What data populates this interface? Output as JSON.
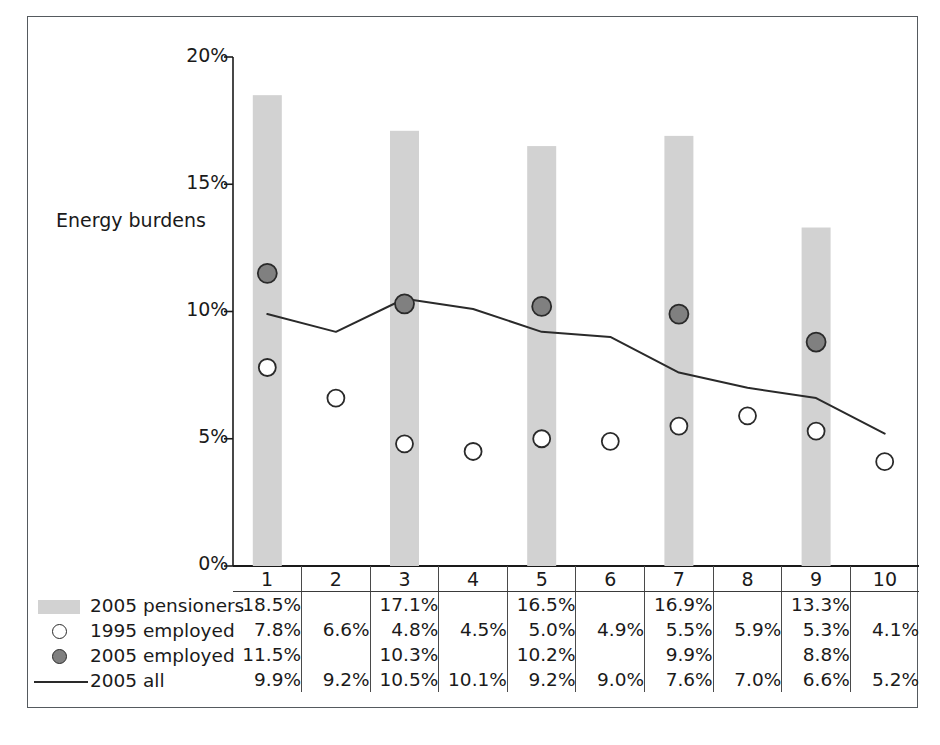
{
  "chart_data": {
    "type": "bar",
    "title": "",
    "xlabel": "",
    "ylabel": "Energy burdens",
    "ylim": [
      0,
      20
    ],
    "ytick_labels": [
      "20%",
      "15%",
      "10%",
      "5%",
      "0%"
    ],
    "ytick_values": [
      20,
      15,
      10,
      5,
      0
    ],
    "grid": false,
    "legend_position": "bottom-left-table",
    "categories": [
      "1",
      "2",
      "3",
      "4",
      "5",
      "6",
      "7",
      "8",
      "9",
      "10"
    ],
    "series": [
      {
        "name": "2005 pensioners",
        "render": "bar",
        "color": "#d2d2d2",
        "values": [
          18.5,
          null,
          17.1,
          null,
          16.5,
          null,
          16.9,
          null,
          13.3,
          null
        ],
        "labels": [
          "18.5%",
          "",
          "17.1%",
          "",
          "16.5%",
          "",
          "16.9%",
          "",
          "13.3%",
          ""
        ]
      },
      {
        "name": "1995 employed",
        "render": "open-circle",
        "color": "#ffffff",
        "values": [
          7.8,
          6.6,
          4.8,
          4.5,
          5.0,
          4.9,
          5.5,
          5.9,
          5.3,
          4.1
        ],
        "labels": [
          "7.8%",
          "6.6%",
          "4.8%",
          "4.5%",
          "5.0%",
          "4.9%",
          "5.5%",
          "5.9%",
          "5.3%",
          "4.1%"
        ]
      },
      {
        "name": "2005 employed",
        "render": "filled-circle",
        "color": "#808080",
        "values": [
          11.5,
          null,
          10.3,
          null,
          10.2,
          null,
          9.9,
          null,
          8.8,
          null
        ],
        "labels": [
          "11.5%",
          "",
          "10.3%",
          "",
          "10.2%",
          "",
          "9.9%",
          "",
          "8.8%",
          ""
        ]
      },
      {
        "name": "2005 all",
        "render": "line",
        "color": "#2a2a2a",
        "values": [
          9.9,
          9.2,
          10.5,
          10.1,
          9.2,
          9.0,
          7.6,
          7.0,
          6.6,
          5.2
        ],
        "labels": [
          "9.9%",
          "9.2%",
          "10.5%",
          "10.1%",
          "9.2%",
          "9.0%",
          "7.6%",
          "7.0%",
          "6.6%",
          "5.2%"
        ]
      }
    ]
  },
  "axis": {
    "title": "Energy burdens",
    "yticks": [
      "20%",
      "15%",
      "10%",
      "5%",
      "0%"
    ]
  },
  "table": {
    "header_row": [
      "1",
      "2",
      "3",
      "4",
      "5",
      "6",
      "7",
      "8",
      "9",
      "10"
    ],
    "rows": [
      {
        "legend": "2005 pensioners",
        "symbol": "bar-swatch",
        "values": [
          "18.5%",
          "",
          "17.1%",
          "",
          "16.5%",
          "",
          "16.9%",
          "",
          "13.3%",
          ""
        ]
      },
      {
        "legend": "1995 employed",
        "symbol": "open-circle",
        "values": [
          "7.8%",
          "6.6%",
          "4.8%",
          "4.5%",
          "5.0%",
          "4.9%",
          "5.5%",
          "5.9%",
          "5.3%",
          "4.1%"
        ]
      },
      {
        "legend": "2005 employed",
        "symbol": "filled-circle",
        "values": [
          "11.5%",
          "",
          "10.3%",
          "",
          "10.2%",
          "",
          "9.9%",
          "",
          "8.8%",
          ""
        ]
      },
      {
        "legend": "2005 all",
        "symbol": "line-swatch",
        "values": [
          "9.9%",
          "9.2%",
          "10.5%",
          "10.1%",
          "9.2%",
          "9.0%",
          "7.6%",
          "7.0%",
          "6.6%",
          "5.2%"
        ]
      }
    ]
  },
  "colors": {
    "bar": "#d2d2d2",
    "filled_marker": "#808080",
    "marker_stroke": "#2a2a2a",
    "line": "#2a2a2a",
    "frame": "#555a5e",
    "text": "#1a1a1a"
  }
}
